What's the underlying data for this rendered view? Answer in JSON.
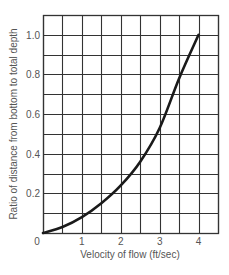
{
  "chart_data": {
    "type": "line",
    "title": "",
    "xlabel": "Velocity of flow (ft/sec)",
    "ylabel": "Ratio of distance from bottom to total depth",
    "xlim": [
      0,
      4.5
    ],
    "ylim": [
      0,
      1.1
    ],
    "grid": true,
    "grid_step_x": 0.5,
    "grid_step_y": 0.1,
    "x_ticks": [
      "0",
      "1",
      "2",
      "3",
      "4"
    ],
    "y_ticks": [
      "0.2",
      "0.4",
      "0.6",
      "0.8",
      "1.0"
    ],
    "legend": null,
    "series": [
      {
        "name": "velocity profile",
        "x": [
          0,
          0.5,
          1.0,
          1.5,
          2.0,
          2.5,
          3.0,
          3.5,
          4.0
        ],
        "y": [
          0.0,
          0.03,
          0.08,
          0.15,
          0.24,
          0.36,
          0.53,
          0.78,
          1.0
        ],
        "color": "#1a1a1a"
      }
    ]
  },
  "colors": {
    "grid": "#333333",
    "text": "#555555",
    "curve": "#1a1a1a"
  }
}
